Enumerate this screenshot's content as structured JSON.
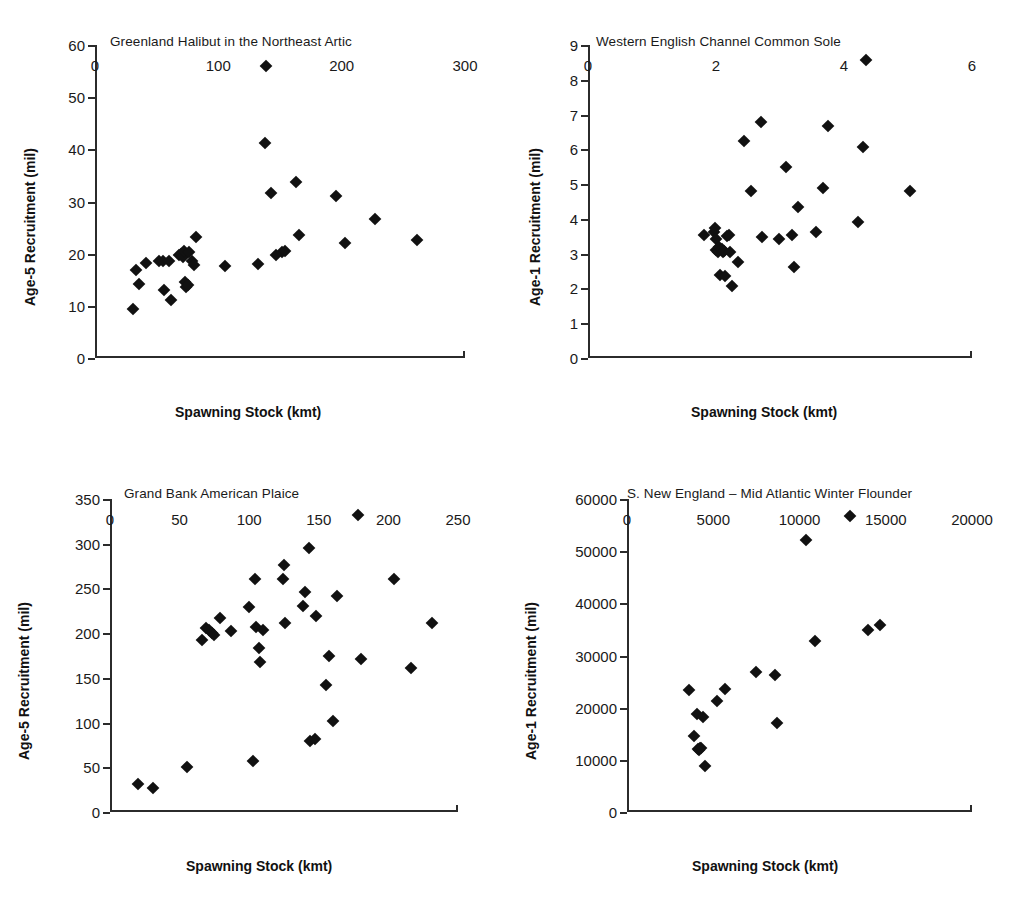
{
  "figure": {
    "background": "#ffffff",
    "marker_color": "#111111",
    "axis_color": "#2b2b2b"
  },
  "chart_data": [
    {
      "id": "greenland-halibut",
      "type": "scatter",
      "title": "Greenland Halibut in the Northeast Artic",
      "xlabel": "Spawning Stock (kmt)",
      "ylabel": "Age-5 Recruitment (mil)",
      "xlim": [
        0,
        300
      ],
      "ylim": [
        0,
        60
      ],
      "xticks": [
        0,
        100,
        200,
        300
      ],
      "yticks": [
        0,
        10,
        20,
        30,
        40,
        50,
        60
      ],
      "grid": false,
      "legend": null,
      "points": [
        [
          31,
          9.4
        ],
        [
          33,
          16.8
        ],
        [
          36,
          14.1
        ],
        [
          41,
          18.3
        ],
        [
          52,
          18.6
        ],
        [
          55,
          18.6
        ],
        [
          56,
          13.0
        ],
        [
          60,
          18.6
        ],
        [
          62,
          11.2
        ],
        [
          68,
          19.7
        ],
        [
          70,
          19.9
        ],
        [
          71,
          19.4
        ],
        [
          72,
          20.6
        ],
        [
          73,
          14.5
        ],
        [
          74,
          13.6
        ],
        [
          75,
          13.9
        ],
        [
          76,
          20.3
        ],
        [
          79,
          18.6
        ],
        [
          80,
          17.8
        ],
        [
          82,
          23.2
        ],
        [
          105,
          17.7
        ],
        [
          132,
          18.1
        ],
        [
          139,
          55.9
        ],
        [
          138,
          41.3
        ],
        [
          143,
          31.7
        ],
        [
          147,
          19.7
        ],
        [
          152,
          20.4
        ],
        [
          154,
          20.6
        ],
        [
          163,
          33.7
        ],
        [
          165,
          23.6
        ],
        [
          195,
          31.1
        ],
        [
          203,
          22.1
        ],
        [
          227,
          26.6
        ],
        [
          261,
          22.7
        ]
      ]
    },
    {
      "id": "western-english-channel-common-sole",
      "type": "scatter",
      "title": "Western English Channel Common Sole",
      "xlabel": "Spawning Stock (kmt)",
      "ylabel": "Age-1 Recruitment (mil)",
      "xlim": [
        0,
        6
      ],
      "ylim": [
        0,
        9
      ],
      "xticks": [
        0,
        2,
        4,
        6
      ],
      "yticks": [
        0,
        1,
        2,
        3,
        4,
        5,
        6,
        7,
        8,
        9
      ],
      "grid": false,
      "legend": null,
      "points": [
        [
          1.82,
          3.53
        ],
        [
          1.97,
          3.62
        ],
        [
          1.99,
          3.75
        ],
        [
          2.0,
          3.42
        ],
        [
          2.0,
          3.1
        ],
        [
          2.03,
          3.05
        ],
        [
          2.05,
          3.2
        ],
        [
          2.1,
          3.12
        ],
        [
          2.11,
          3.05
        ],
        [
          2.13,
          3.08
        ],
        [
          2.07,
          2.38
        ],
        [
          2.14,
          2.37
        ],
        [
          2.17,
          3.5
        ],
        [
          2.2,
          3.55
        ],
        [
          2.22,
          3.05
        ],
        [
          2.25,
          2.07
        ],
        [
          2.35,
          2.75
        ],
        [
          2.43,
          6.25
        ],
        [
          2.55,
          4.81
        ],
        [
          2.7,
          6.79
        ],
        [
          2.72,
          3.47
        ],
        [
          2.98,
          3.42
        ],
        [
          3.1,
          5.48
        ],
        [
          3.18,
          3.54
        ],
        [
          3.22,
          2.62
        ],
        [
          3.28,
          4.34
        ],
        [
          3.57,
          3.62
        ],
        [
          3.67,
          4.9
        ],
        [
          3.75,
          6.66
        ],
        [
          4.22,
          3.9
        ],
        [
          4.3,
          6.08
        ],
        [
          4.35,
          8.58
        ],
        [
          5.03,
          4.79
        ]
      ]
    },
    {
      "id": "grand-bank-american-plaice",
      "type": "scatter",
      "title": "Grand Bank American Plaice",
      "xlabel": "Spawning Stock (kmt)",
      "ylabel": "Age-5 Recruitment (mil)",
      "xlim": [
        0,
        250
      ],
      "ylim": [
        0,
        350
      ],
      "xticks": [
        0,
        50,
        100,
        150,
        200,
        250
      ],
      "yticks": [
        0,
        50,
        100,
        150,
        200,
        250,
        300,
        350
      ],
      "grid": false,
      "legend": null,
      "points": [
        [
          20,
          31
        ],
        [
          31,
          27
        ],
        [
          55,
          50
        ],
        [
          66,
          192
        ],
        [
          69,
          206
        ],
        [
          71,
          203
        ],
        [
          73,
          200
        ],
        [
          75,
          198
        ],
        [
          79,
          217
        ],
        [
          87,
          202
        ],
        [
          100,
          229
        ],
        [
          103,
          57
        ],
        [
          104,
          261
        ],
        [
          105,
          207
        ],
        [
          107,
          183
        ],
        [
          108,
          168
        ],
        [
          110,
          204
        ],
        [
          124,
          260
        ],
        [
          125,
          276
        ],
        [
          126,
          211
        ],
        [
          139,
          230
        ],
        [
          140,
          246
        ],
        [
          143,
          295
        ],
        [
          144,
          79
        ],
        [
          147,
          82
        ],
        [
          148,
          219
        ],
        [
          155,
          142
        ],
        [
          157,
          175
        ],
        [
          160,
          102
        ],
        [
          163,
          241
        ],
        [
          178,
          332
        ],
        [
          180,
          171
        ],
        [
          204,
          260
        ],
        [
          216,
          161
        ],
        [
          231,
          211
        ]
      ]
    },
    {
      "id": "s-new-england-mid-atlantic-winter-flounder",
      "type": "scatter",
      "title": "S. New England – Mid Atlantic Winter Flounder",
      "xlabel": "Spawning Stock (kmt)",
      "ylabel": "Age-1 Recruitment (mil)",
      "xlim": [
        0,
        20000
      ],
      "ylim": [
        0,
        60000
      ],
      "xticks": [
        0,
        5000,
        10000,
        15000,
        20000
      ],
      "yticks": [
        0,
        10000,
        20000,
        30000,
        40000,
        50000,
        60000
      ],
      "grid": false,
      "legend": null,
      "points": [
        [
          3600,
          23300
        ],
        [
          3900,
          14500
        ],
        [
          4050,
          18800
        ],
        [
          4100,
          12000
        ],
        [
          4150,
          11900
        ],
        [
          4250,
          12300
        ],
        [
          4300,
          12200
        ],
        [
          4400,
          18300
        ],
        [
          4500,
          8900
        ],
        [
          5200,
          21200
        ],
        [
          5700,
          23600
        ],
        [
          7500,
          26800
        ],
        [
          8600,
          26300
        ],
        [
          8700,
          17000
        ],
        [
          10400,
          52100
        ],
        [
          10900,
          32800
        ],
        [
          12900,
          56700
        ],
        [
          13950,
          34900
        ],
        [
          14650,
          35800
        ]
      ]
    }
  ]
}
